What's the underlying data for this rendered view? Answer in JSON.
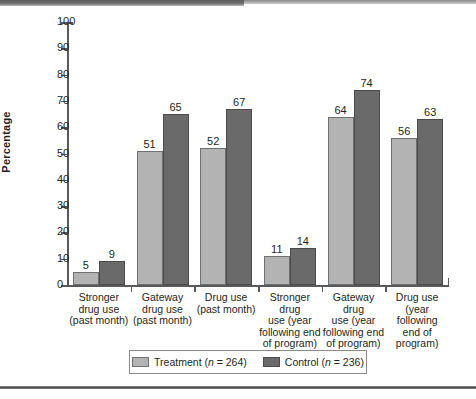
{
  "chart_data": {
    "type": "bar",
    "title": "",
    "xlabel": "",
    "ylabel": "Percentage",
    "ylim": [
      0,
      100
    ],
    "ytick_step": 10,
    "yticks": [
      0,
      10,
      20,
      30,
      40,
      50,
      60,
      70,
      80,
      90,
      100
    ],
    "grid": false,
    "legend_position": "bottom",
    "categories": [
      "Stronger\ndrug use\n(past month)",
      "Gateway\ndrug use\n(past month)",
      "Drug use\n(past month)",
      "Stronger drug\nuse (year\nfollowing end\nof program)",
      "Gateway drug\nuse (year\nfollowing end\nof program)",
      "Drug use\n(year following\nend of\nprogram)"
    ],
    "categories_lines": [
      [
        "Stronger",
        "drug use",
        "(past month)"
      ],
      [
        "Gateway",
        "drug use",
        "(past month)"
      ],
      [
        "Drug use",
        "(past month)"
      ],
      [
        "Stronger drug",
        "use (year",
        "following end",
        "of program)"
      ],
      [
        "Gateway drug",
        "use (year",
        "following end",
        "of program)"
      ],
      [
        "Drug use",
        "(year following",
        "end of",
        "program)"
      ]
    ],
    "series": [
      {
        "name": "Treatment",
        "n": 264,
        "legend_label": "Treatment (n = 264)",
        "color": "#b3b3b3",
        "values": [
          5,
          51,
          52,
          11,
          64,
          56
        ]
      },
      {
        "name": "Control",
        "n": 236,
        "legend_label": "Control (n = 236)",
        "color": "#6a6a6a",
        "values": [
          9,
          65,
          67,
          14,
          74,
          63
        ]
      }
    ]
  },
  "legend": {
    "items": [
      {
        "label_prefix": "Treatment (",
        "n_italic": "n",
        "label_suffix": " = 264)",
        "swatch": "treatment-swatch"
      },
      {
        "label_prefix": "Control (",
        "n_italic": "n",
        "label_suffix": " = 236)",
        "swatch": "control-swatch"
      }
    ]
  },
  "axis": {
    "y_title": "Percentage"
  }
}
